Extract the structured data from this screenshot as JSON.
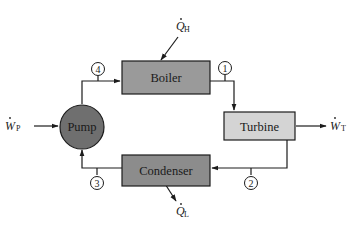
{
  "diagram": {
    "type": "rankine-cycle-schematic",
    "colors": {
      "boiler_fill": "#9a9a9a",
      "turbine_fill": "#d4d4d4",
      "condenser_fill": "#8c8c8c",
      "pump_fill": "#6f6f6f",
      "stroke": "#1c1c1c",
      "background": "#ffffff"
    },
    "components": {
      "boiler": {
        "label": "Boiler"
      },
      "turbine": {
        "label": "Turbine"
      },
      "condenser": {
        "label": "Condenser"
      },
      "pump": {
        "label": "Pump"
      }
    },
    "state_points": [
      {
        "id": "1",
        "label": "1",
        "location": "boiler exit to turbine inlet"
      },
      {
        "id": "2",
        "label": "2",
        "location": "turbine exit to condenser inlet"
      },
      {
        "id": "3",
        "label": "3",
        "location": "condenser exit to pump inlet"
      },
      {
        "id": "4",
        "label": "4",
        "location": "pump exit to boiler inlet"
      }
    ],
    "energy_flows": {
      "heat_in": {
        "symbol": "Q",
        "subscript": "H",
        "dot": "˙",
        "direction": "into boiler"
      },
      "heat_out": {
        "symbol": "Q",
        "subscript": "L",
        "dot": "˙",
        "direction": "out of condenser"
      },
      "work_pump": {
        "symbol": "W",
        "subscript": "P",
        "dot": "˙",
        "direction": "into pump"
      },
      "work_turbine": {
        "symbol": "W",
        "subscript": "T",
        "dot": "˙",
        "direction": "out of turbine"
      }
    }
  }
}
